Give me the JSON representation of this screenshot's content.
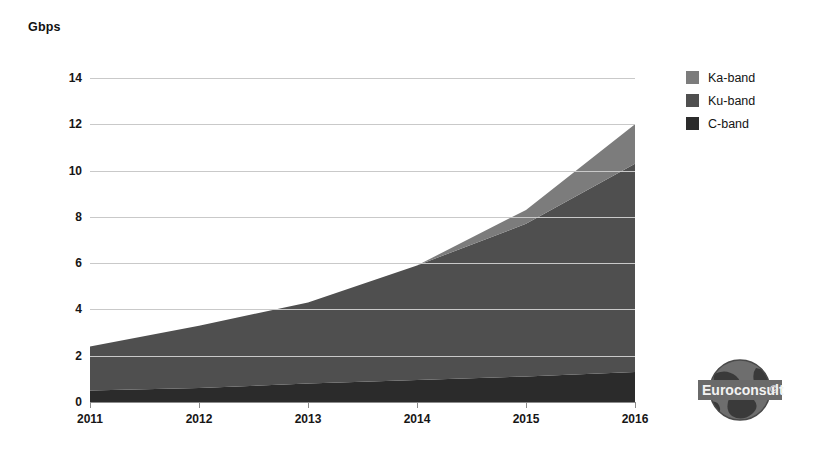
{
  "chart_data": {
    "type": "area",
    "stacked": true,
    "title": "",
    "subtitle": "",
    "xlabel": "",
    "ylabel": "Gbps",
    "categories": [
      "2011",
      "2012",
      "2013",
      "2014",
      "2015",
      "2016"
    ],
    "x": [
      2011,
      2012,
      2013,
      2014,
      2015,
      2016
    ],
    "xlim": [
      2011,
      2016
    ],
    "ylim": [
      0,
      14
    ],
    "yticks": [
      0,
      2,
      4,
      6,
      8,
      10,
      12,
      14
    ],
    "ytick_labels": [
      "0",
      "2",
      "4",
      "6",
      "8",
      "10",
      "12",
      "14"
    ],
    "grid": true,
    "legend_position": "right",
    "series": [
      {
        "name": "C-band",
        "color": "#2b2b2b",
        "values": [
          0.5,
          0.6,
          0.8,
          0.95,
          1.1,
          1.3
        ]
      },
      {
        "name": "Ku-band",
        "color": "#4f4f4f",
        "values": [
          1.9,
          2.7,
          3.5,
          4.95,
          6.6,
          9.0
        ]
      },
      {
        "name": "Ka-band",
        "color": "#7c7c7c",
        "values": [
          0.0,
          0.0,
          0.0,
          0.0,
          0.6,
          1.7
        ]
      }
    ],
    "cumulative_totals": [
      2.4,
      3.3,
      4.3,
      5.9,
      8.3,
      12.0
    ],
    "annotations": []
  },
  "legend": {
    "items": [
      {
        "label": "Ka-band",
        "color": "#7c7c7c"
      },
      {
        "label": "Ku-band",
        "color": "#4f4f4f"
      },
      {
        "label": "C-band",
        "color": "#2b2b2b"
      }
    ]
  },
  "watermark": {
    "brand": "Euroconsult",
    "mark": "©"
  },
  "colors": {
    "background": "#ffffff",
    "grid": "#c9c9c9",
    "axis": "#8a8a8a",
    "text": "#161616"
  }
}
